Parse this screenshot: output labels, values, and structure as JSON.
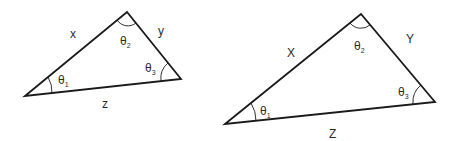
{
  "triangles": [
    {
      "name": "small-triangle",
      "vertices": {
        "left": [
          25,
          96
        ],
        "top": [
          127,
          12
        ],
        "right": [
          181,
          79
        ]
      },
      "sides": {
        "left_top": "x",
        "top_right": "y",
        "bottom": "z"
      },
      "angles": {
        "left": "θ",
        "left_sub": "1",
        "top": "θ",
        "top_sub": "2",
        "right": "θ",
        "right_sub": "3"
      }
    },
    {
      "name": "large-triangle",
      "vertices": {
        "left": [
          225,
          124
        ],
        "top": [
          361,
          14
        ],
        "right": [
          435,
          102
        ]
      },
      "sides": {
        "left_top": "X",
        "top_right": "Y",
        "bottom": "Z"
      },
      "angles": {
        "left": "θ",
        "left_sub": "1",
        "top": "θ",
        "top_sub": "2",
        "right": "θ",
        "right_sub": "3"
      }
    }
  ],
  "colors": {
    "stroke": "#1a1a1a",
    "background": "#ffffff"
  }
}
